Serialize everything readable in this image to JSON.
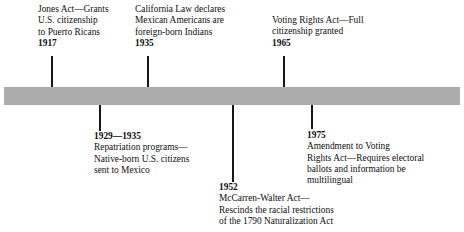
{
  "figure": {
    "type": "horizontal-timeline",
    "bar_color": "#abacab",
    "tick_color": "#161616",
    "text_color": "#100f0f",
    "background": "#ffffff"
  },
  "entries": [
    {
      "id": "jones-act",
      "year": "1917",
      "position": "above",
      "year_position": "bottom",
      "lines": [
        "Jones Act—Grants",
        "U.S. citizenship",
        "to Puerto Ricans"
      ]
    },
    {
      "id": "california-law",
      "year": "1935",
      "position": "above",
      "year_position": "bottom",
      "lines": [
        "California Law declares",
        "Mexican Americans are",
        "foreign-born Indians"
      ]
    },
    {
      "id": "voting-rights-act",
      "year": "1965",
      "position": "above",
      "year_position": "bottom",
      "lines": [
        "Voting Rights Act—Full",
        "citizenship granted"
      ]
    },
    {
      "id": "repatriation-programs",
      "year": "1929—1935",
      "position": "below",
      "year_position": "top",
      "lines": [
        "Repatriation programs—",
        "Native-born U.S. citizens",
        "sent to Mexico"
      ]
    },
    {
      "id": "mccarren-walter-act",
      "year": "1952",
      "position": "below",
      "year_position": "top",
      "lines": [
        "McCarren-Walter Act—",
        "Rescinds the racial restrictions",
        "of the 1790 Naturalization Act"
      ]
    },
    {
      "id": "voting-rights-amendment",
      "year": "1975",
      "position": "below",
      "year_position": "top",
      "lines": [
        "Amendment to Voting",
        "Rights Act—Requires electoral",
        "ballots and information be",
        "multilingual"
      ]
    }
  ]
}
